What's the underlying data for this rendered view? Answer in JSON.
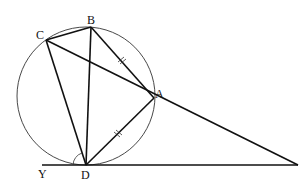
{
  "diagram": {
    "points": {
      "A": {
        "label": "A",
        "x": 154,
        "y": 98
      },
      "B": {
        "label": "B",
        "x": 91,
        "y": 27
      },
      "C": {
        "label": "C",
        "x": 46,
        "y": 40
      },
      "D": {
        "label": "D",
        "x": 86,
        "y": 164
      },
      "X": {
        "label": "X",
        "x": 298,
        "y": 164
      },
      "Y": {
        "label": "Y",
        "x": 42,
        "y": 164
      }
    },
    "circle": {
      "cx": 86,
      "cy": 96,
      "r": 69
    },
    "angles": {
      "at_D": "54°",
      "at_X": "30°"
    },
    "equal_marks": [
      "BA",
      "AD"
    ],
    "line_color": "#111111"
  }
}
